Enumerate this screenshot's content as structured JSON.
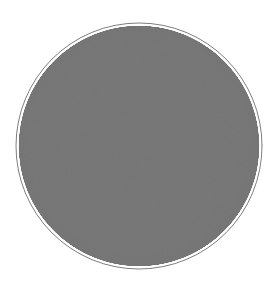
{
  "figure": {
    "caption": "Order-3 heptagonal tiling {7,3} rendered in the Poincare disk model"
  },
  "chart_data": {
    "type": "diagram",
    "diagram_kind": "hyperbolic-tiling",
    "model": "Poincare disk",
    "schlafli_symbol": "{7,3}",
    "polygon_sides": 7,
    "polygons_per_vertex": 3,
    "xlabel": "",
    "ylabel": "",
    "legend": [],
    "annotations": [],
    "grid": false,
    "canvas": {
      "width": 277,
      "height": 293,
      "background": "#ffffff"
    },
    "boundary_circle": {
      "center_x": 139,
      "center_y": 146,
      "radius": 123,
      "stroke": "#6f6f6f",
      "stroke_width": 0.9,
      "fill": "none"
    },
    "tiling": {
      "center_x": 139,
      "center_y": 146,
      "radius": 120.5,
      "max_depth": 7,
      "center_rotation_deg": 180,
      "stroke": "#777777",
      "stroke_width": 0.65,
      "fill": "none",
      "min_pixel_edge": 0.55
    },
    "style": {
      "line_color": "#777777",
      "boundary_color": "#6f6f6f",
      "background_color": "#ffffff",
      "line_width": 0.65
    }
  }
}
